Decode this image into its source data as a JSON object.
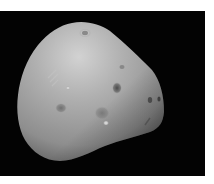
{
  "image": {
    "subject": "irregular grey moon (Deimos-like) on black space background",
    "alt": "Grey, potato-shaped moon with small craters against black space",
    "colors": {
      "background": "#030303",
      "surface": "#9c9c9c",
      "highlight": "#cfcfcf",
      "shadow": "#5a5a5a",
      "crater": "#4a4a4a"
    }
  },
  "caption": {
    "text": ""
  }
}
